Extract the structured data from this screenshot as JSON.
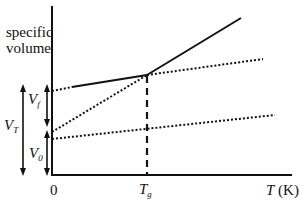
{
  "diagram": {
    "y_axis_label_line1": "specific",
    "y_axis_label_line2": "volume",
    "x_axis_label_var": "T",
    "x_axis_label_unit": " (K)",
    "origin_label": "0",
    "tg_label_main": "T",
    "tg_label_sub": "g",
    "vf_label_main": "V",
    "vf_label_sub": "f",
    "vt_label_main": "V",
    "vt_label_sub": "T",
    "v0_label_main": "V",
    "v0_label_sub": "0",
    "colors": {
      "line": "#111111",
      "background": "#ffffff"
    }
  }
}
